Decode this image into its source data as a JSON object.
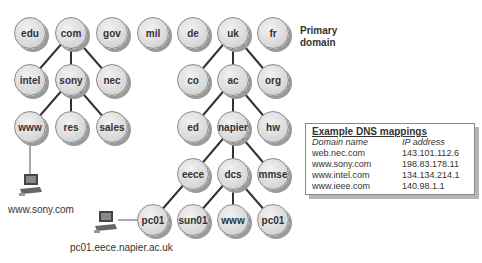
{
  "diagram": {
    "primary_label": [
      "Primary",
      "domain"
    ],
    "nodes": [
      {
        "id": "edu",
        "label": "edu",
        "x": 30,
        "y": 33
      },
      {
        "id": "com",
        "label": "com",
        "x": 71,
        "y": 33
      },
      {
        "id": "gov",
        "label": "gov",
        "x": 112,
        "y": 33
      },
      {
        "id": "mil",
        "label": "mil",
        "x": 153,
        "y": 33
      },
      {
        "id": "de",
        "label": "de",
        "x": 193,
        "y": 33
      },
      {
        "id": "uk",
        "label": "uk",
        "x": 233,
        "y": 33
      },
      {
        "id": "fr",
        "label": "fr",
        "x": 273,
        "y": 33
      },
      {
        "id": "intel",
        "label": "intel",
        "x": 30,
        "y": 80
      },
      {
        "id": "sony",
        "label": "sony",
        "x": 71,
        "y": 80
      },
      {
        "id": "nec",
        "label": "nec",
        "x": 112,
        "y": 80
      },
      {
        "id": "co",
        "label": "co",
        "x": 193,
        "y": 80
      },
      {
        "id": "ac",
        "label": "ac",
        "x": 233,
        "y": 80
      },
      {
        "id": "org",
        "label": "org",
        "x": 273,
        "y": 80
      },
      {
        "id": "www1",
        "label": "www",
        "x": 30,
        "y": 127
      },
      {
        "id": "res",
        "label": "res",
        "x": 71,
        "y": 127
      },
      {
        "id": "sales",
        "label": "sales",
        "x": 112,
        "y": 127
      },
      {
        "id": "ed",
        "label": "ed",
        "x": 193,
        "y": 127
      },
      {
        "id": "napier",
        "label": "napier",
        "x": 233,
        "y": 127
      },
      {
        "id": "hw",
        "label": "hw",
        "x": 273,
        "y": 127
      },
      {
        "id": "eece",
        "label": "eece",
        "x": 193,
        "y": 174
      },
      {
        "id": "dcs",
        "label": "dcs",
        "x": 233,
        "y": 174
      },
      {
        "id": "mmse",
        "label": "mmse",
        "x": 273,
        "y": 174
      },
      {
        "id": "pc01a",
        "label": "pc01",
        "x": 153,
        "y": 220
      },
      {
        "id": "sun01",
        "label": "sun01",
        "x": 193,
        "y": 220
      },
      {
        "id": "www2",
        "label": "www",
        "x": 233,
        "y": 220
      },
      {
        "id": "pc01b",
        "label": "pc01",
        "x": 273,
        "y": 220
      }
    ],
    "edges": [
      [
        "com",
        "intel"
      ],
      [
        "com",
        "sony"
      ],
      [
        "com",
        "nec"
      ],
      [
        "sony",
        "www1"
      ],
      [
        "sony",
        "res"
      ],
      [
        "sony",
        "sales"
      ],
      [
        "uk",
        "co"
      ],
      [
        "uk",
        "ac"
      ],
      [
        "uk",
        "org"
      ],
      [
        "ac",
        "ed"
      ],
      [
        "ac",
        "napier"
      ],
      [
        "ac",
        "hw"
      ],
      [
        "napier",
        "eece"
      ],
      [
        "napier",
        "dcs"
      ],
      [
        "napier",
        "mmse"
      ],
      [
        "eece",
        "pc01a"
      ],
      [
        "dcs",
        "sun01"
      ],
      [
        "dcs",
        "www2"
      ],
      [
        "dcs",
        "pc01b"
      ]
    ],
    "computers": [
      {
        "label": "www.sony.com",
        "icon": "computer-icon"
      },
      {
        "label": "pc01.eece.napier.ac.uk",
        "icon": "computer-icon"
      }
    ]
  },
  "dns_table": {
    "title": "Example DNS mappings",
    "headers": [
      "Domain name",
      "IP address"
    ],
    "rows": [
      [
        "web.nec.com",
        "143.101.112.6"
      ],
      [
        "www.sony.com",
        "198.83.178.11"
      ],
      [
        "www.intel.com",
        "134.134.214.1"
      ],
      [
        "www.ieee.com",
        "140.98.1.1"
      ]
    ]
  }
}
